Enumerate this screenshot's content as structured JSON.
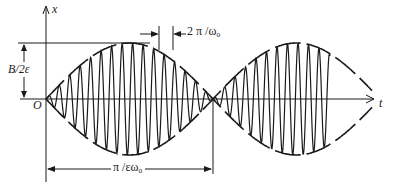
{
  "diagram": {
    "type": "beat-oscillation",
    "labels": {
      "x_axis": "x",
      "t_axis": "t",
      "origin": "O",
      "amplitude": "B/2ε",
      "carrier_period": "2 π /ω₀",
      "beat_half_period": "π /εω₀"
    },
    "colors": {
      "stroke": "#1a1a1a",
      "background": "#ffffff"
    }
  }
}
